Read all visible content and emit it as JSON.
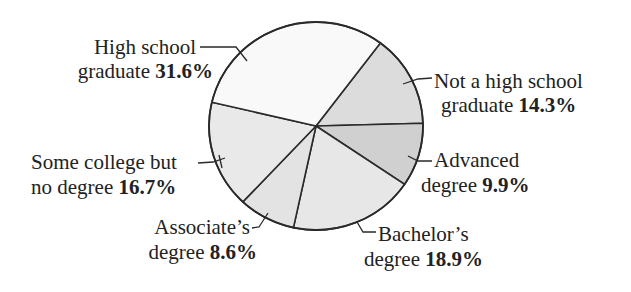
{
  "chart_data": {
    "type": "pie",
    "title": "",
    "categories": [
      "Not a high school graduate",
      "Advanced degree",
      "Bachelor's degree",
      "Associate's degree",
      "Some college but no degree",
      "High school graduate"
    ],
    "values": [
      14.3,
      9.9,
      18.9,
      8.6,
      16.7,
      31.6
    ],
    "unit": "%",
    "colors": [
      "#dcdcdc",
      "#d0d0d0",
      "#e7e7e7",
      "#e3e3e3",
      "#e9e9e9",
      "#f9f9f9"
    ],
    "start_angle_deg": -53,
    "direction": "clockwise",
    "legend": "none (direct labels with leader lines)"
  },
  "labels": {
    "high_school": {
      "line1": "High school",
      "line2": "graduate ",
      "pct": "31.6%"
    },
    "not_high_school": {
      "line1": "Not a high school",
      "line2": "graduate ",
      "pct": "14.3%"
    },
    "advanced": {
      "line1": "Advanced",
      "line2": "degree ",
      "pct": "9.9%"
    },
    "bachelors": {
      "line1": "Bachelor’s",
      "line2": "degree ",
      "pct": "18.9%"
    },
    "associates": {
      "line1": "Associate’s",
      "line2": "degree ",
      "pct": "8.6%"
    },
    "some_college": {
      "line1": "Some college but",
      "line2": "no degree ",
      "pct": "16.7%"
    }
  }
}
